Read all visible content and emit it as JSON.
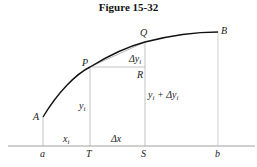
{
  "figure": {
    "title": "Figure 15-32"
  },
  "points": {
    "A": "A",
    "P": "P",
    "Q": "Q",
    "B": "B",
    "R": "R"
  },
  "axis_labels": {
    "a": "a",
    "T": "T",
    "S": "S",
    "b": "b"
  },
  "segment_labels": {
    "xi": "x",
    "xi_sub": "i",
    "dx": "Δx",
    "yi": "y",
    "yi_sub": "i",
    "dyi": "Δy",
    "dyi_sub": "i",
    "yi_plus_dyi": "y",
    "yi_plus_dyi_sub": "i",
    "yi_plus_dyi_rest": " + Δy",
    "yi_plus_dyi_rest_sub": "i"
  },
  "colors": {
    "curve": "#111111",
    "guide": "#aaaaaa",
    "axis": "#888888"
  }
}
